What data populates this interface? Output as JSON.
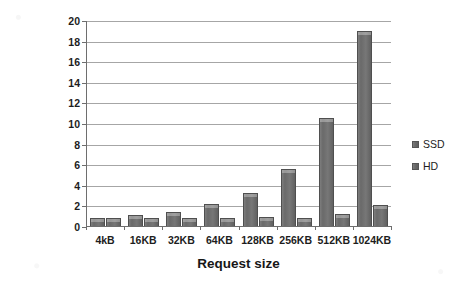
{
  "chart_data": {
    "type": "bar",
    "title": "",
    "xlabel": "Request size",
    "ylabel": "Standard response time",
    "categories": [
      "4kB",
      "16KB",
      "32KB",
      "64KB",
      "128KB",
      "256KB",
      "512KB",
      "1024KB"
    ],
    "series": [
      {
        "name": "SSD",
        "values": [
          0.9,
          1.15,
          1.5,
          2.2,
          3.3,
          5.6,
          10.6,
          19.0
        ]
      },
      {
        "name": "HD",
        "values": [
          0.9,
          0.85,
          0.9,
          0.85,
          0.95,
          0.9,
          1.3,
          2.1
        ]
      }
    ],
    "ylim": [
      0,
      20
    ],
    "yticks": [
      0,
      2,
      4,
      6,
      8,
      10,
      12,
      14,
      16,
      18,
      20
    ],
    "ytick_labels": [
      "0",
      "2",
      "4",
      "6",
      "8",
      "10",
      "12",
      "14",
      "16",
      "18",
      "20"
    ],
    "grid": true,
    "legend_position": "right",
    "legend": [
      "SSD",
      "HD"
    ],
    "colors": {
      "bar_fill": "#6f6f6f",
      "bar_edge": "#4f4f4f",
      "gridline": "#a6a6a6",
      "axis": "#6e6e6e",
      "text": "#1d1d1d",
      "background": "#ffffff"
    }
  }
}
